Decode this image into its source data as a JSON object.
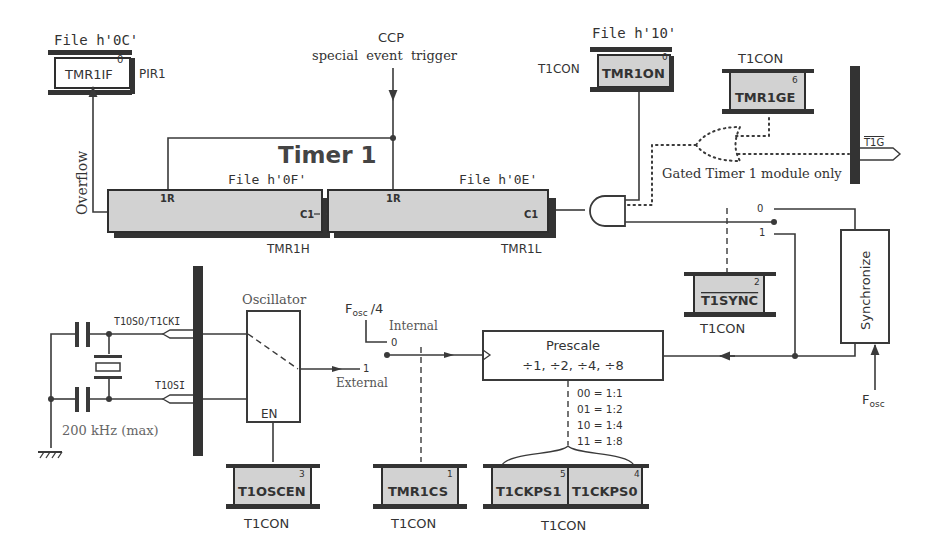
{
  "diagram": {
    "title": "Timer 1",
    "pir1_register": {
      "file": "File h'0C'",
      "bit_name": "TMR1IF",
      "bit_num": "0",
      "reg_name": "PIR1"
    },
    "ccp_trigger": {
      "line1": "CCP",
      "line2": "special  event  trigger"
    },
    "tmr1on_register": {
      "file": "File h'10'",
      "reg_name": "T1CON",
      "bit_name": "TMR1ON",
      "bit_num": "0"
    },
    "tmr1ge_register": {
      "reg_name": "T1CON",
      "bit_name": "TMR1GE",
      "bit_num": "6"
    },
    "t1g_pin": {
      "label": "T1G"
    },
    "gated_note": "Gated Timer 1 module only",
    "overflow_label": "Overflow",
    "tmr1h": {
      "file": "File h'0F'",
      "name": "TMR1H",
      "reset": "1R",
      "clock": "C1"
    },
    "tmr1l": {
      "file": "File h'0E'",
      "name": "TMR1L",
      "reset": "1R",
      "clock": "C1"
    },
    "sync_switch": {
      "in0": "0",
      "in1": "1"
    },
    "t1sync_register": {
      "bit_name": "T1SYNC",
      "bit_num": "2",
      "reg_name": "T1CON"
    },
    "synchronize_block": {
      "label": "Synchronize",
      "clock": "F",
      "clock_sub": "osc"
    },
    "oscillator": {
      "label": "Oscillator",
      "enable": "EN",
      "pin0": "T1OSO/T1CKI",
      "pin1": "T1OSI",
      "crystal_note": "200 kHz (max)"
    },
    "clock_switch": {
      "fosc": "F",
      "fosc_sub": "osc",
      "fosc_div": "/4",
      "internal": "Internal",
      "external": "External",
      "in0": "0",
      "in1": "1"
    },
    "prescaler": {
      "title": "Prescale",
      "ratios": "÷1, ÷2, ÷4, ÷8",
      "table": [
        "00 = 1:1",
        "01 = 1:2",
        "10 = 1:4",
        "11 = 1:8"
      ]
    },
    "t1oscen_register": {
      "bit_name": "T1OSCEN",
      "bit_num": "3",
      "reg_name": "T1CON"
    },
    "tmr1cs_register": {
      "bit_name": "TMR1CS",
      "bit_num": "1",
      "reg_name": "T1CON"
    },
    "t1ckps_register": {
      "bit1_name": "T1CKPS1",
      "bit1_num": "5",
      "bit0_name": "T1CKPS0",
      "bit0_num": "4",
      "reg_name": "T1CON"
    },
    "colors": {
      "register_fill": "#d2d2d2",
      "line": "#3a3a3a",
      "text": "#333333"
    }
  }
}
